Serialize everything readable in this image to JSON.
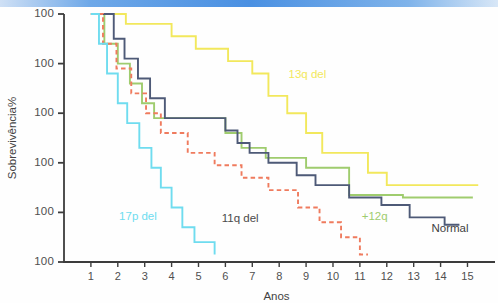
{
  "chart_data": {
    "type": "line",
    "subtype": "kaplan-meier-step",
    "title": "",
    "xlabel": "Anos",
    "ylabel": "Sobrevivência%",
    "xlim": [
      0,
      15.8
    ],
    "ylim": [
      0,
      100
    ],
    "grid": false,
    "legend_position": "inline-annotations",
    "xticks": [
      1,
      2,
      3,
      4,
      5,
      6,
      7,
      8,
      9,
      10,
      11,
      12,
      13,
      14,
      15
    ],
    "xtick_labels": [
      "1",
      "2",
      "3",
      "4",
      "5",
      "6",
      "7",
      "8",
      "9",
      "10",
      "11",
      "12",
      "13",
      "14",
      "15"
    ],
    "ytick_labels": [
      "100",
      "100",
      "100",
      "100",
      "100",
      "100"
    ],
    "ytick_values": [
      100,
      80,
      60,
      40,
      20,
      0
    ],
    "ytick_note": "All six y-axis tick labels are rendered as '100' in the source scan",
    "series": [
      {
        "name": "13q del",
        "color": "#f2e85c",
        "dashed": false,
        "label_x": 9.05,
        "label_y": 74,
        "points": [
          [
            1,
            100
          ],
          [
            2.3,
            100
          ],
          [
            2.3,
            96
          ],
          [
            4.0,
            96
          ],
          [
            4.0,
            91
          ],
          [
            4.9,
            91
          ],
          [
            4.9,
            86
          ],
          [
            6.1,
            86
          ],
          [
            6.1,
            81
          ],
          [
            7.0,
            81
          ],
          [
            7.0,
            76
          ],
          [
            7.6,
            76
          ],
          [
            7.6,
            67
          ],
          [
            8.3,
            67
          ],
          [
            8.3,
            60
          ],
          [
            9.0,
            60
          ],
          [
            9.0,
            52
          ],
          [
            9.6,
            52
          ],
          [
            9.6,
            44
          ],
          [
            11.3,
            44
          ],
          [
            11.3,
            36
          ],
          [
            12.0,
            36
          ],
          [
            12.0,
            31
          ],
          [
            15.4,
            31
          ]
        ]
      },
      {
        "name": "+12q",
        "color": "#9fcc6e",
        "dashed": false,
        "label_x": 11.55,
        "label_y": 17,
        "points": [
          [
            1,
            100
          ],
          [
            1.5,
            100
          ],
          [
            1.5,
            88
          ],
          [
            2.0,
            88
          ],
          [
            2.0,
            80
          ],
          [
            2.45,
            80
          ],
          [
            2.45,
            72
          ],
          [
            2.9,
            72
          ],
          [
            2.9,
            64
          ],
          [
            3.35,
            64
          ],
          [
            3.35,
            58
          ],
          [
            6.0,
            58
          ],
          [
            6.0,
            52
          ],
          [
            6.6,
            52
          ],
          [
            6.6,
            46
          ],
          [
            7.5,
            46
          ],
          [
            7.5,
            42
          ],
          [
            9.0,
            42
          ],
          [
            9.0,
            38
          ],
          [
            10.6,
            38
          ],
          [
            10.6,
            27
          ],
          [
            12.6,
            27
          ],
          [
            12.6,
            26
          ],
          [
            15.2,
            26
          ]
        ]
      },
      {
        "name": "Normal",
        "color": "#4e5a77",
        "dashed": false,
        "label_x": 14.35,
        "label_y": 12,
        "points": [
          [
            1,
            100
          ],
          [
            1.85,
            100
          ],
          [
            1.85,
            90
          ],
          [
            2.25,
            90
          ],
          [
            2.25,
            82
          ],
          [
            2.75,
            82
          ],
          [
            2.75,
            74
          ],
          [
            3.2,
            74
          ],
          [
            3.2,
            66
          ],
          [
            3.75,
            66
          ],
          [
            3.75,
            58
          ],
          [
            6.0,
            58
          ],
          [
            6.0,
            53
          ],
          [
            6.45,
            53
          ],
          [
            6.45,
            48
          ],
          [
            6.9,
            48
          ],
          [
            6.9,
            44
          ],
          [
            7.6,
            44
          ],
          [
            7.6,
            40
          ],
          [
            8.65,
            40
          ],
          [
            8.65,
            35
          ],
          [
            9.35,
            35
          ],
          [
            9.35,
            31
          ],
          [
            10.6,
            31
          ],
          [
            10.6,
            26
          ],
          [
            11.8,
            26
          ],
          [
            11.8,
            23
          ],
          [
            12.85,
            23
          ],
          [
            12.85,
            18
          ],
          [
            14.15,
            18
          ],
          [
            14.15,
            15
          ],
          [
            14.7,
            15
          ]
        ]
      },
      {
        "name": "11q del",
        "color": "#ef7b5e",
        "dashed": true,
        "label_x": 6.55,
        "label_y": 16,
        "points": [
          [
            1,
            100
          ],
          [
            1.45,
            100
          ],
          [
            1.45,
            88
          ],
          [
            1.95,
            88
          ],
          [
            1.95,
            78
          ],
          [
            2.5,
            78
          ],
          [
            2.5,
            68
          ],
          [
            3.05,
            68
          ],
          [
            3.05,
            60
          ],
          [
            3.6,
            60
          ],
          [
            3.6,
            52
          ],
          [
            4.6,
            52
          ],
          [
            4.6,
            44
          ],
          [
            5.6,
            44
          ],
          [
            5.6,
            39
          ],
          [
            6.6,
            39
          ],
          [
            6.6,
            34
          ],
          [
            7.6,
            34
          ],
          [
            7.6,
            29
          ],
          [
            8.7,
            29
          ],
          [
            8.7,
            22
          ],
          [
            9.5,
            22
          ],
          [
            9.5,
            16
          ],
          [
            10.3,
            16
          ],
          [
            10.3,
            10
          ],
          [
            11.0,
            10
          ],
          [
            11.0,
            3
          ],
          [
            11.3,
            3
          ]
        ]
      },
      {
        "name": "17p del",
        "color": "#6fdcef",
        "dashed": false,
        "label_x": 2.75,
        "label_y": 17,
        "points": [
          [
            1,
            100
          ],
          [
            1.3,
            100
          ],
          [
            1.3,
            88
          ],
          [
            1.6,
            88
          ],
          [
            1.6,
            76
          ],
          [
            2.0,
            76
          ],
          [
            2.0,
            64
          ],
          [
            2.35,
            64
          ],
          [
            2.35,
            56
          ],
          [
            2.8,
            56
          ],
          [
            2.8,
            46
          ],
          [
            3.25,
            46
          ],
          [
            3.25,
            38
          ],
          [
            3.6,
            38
          ],
          [
            3.6,
            30
          ],
          [
            4.0,
            30
          ],
          [
            4.0,
            22
          ],
          [
            4.4,
            22
          ],
          [
            4.4,
            14
          ],
          [
            4.85,
            14
          ],
          [
            4.85,
            8
          ],
          [
            5.6,
            8
          ],
          [
            5.6,
            3
          ]
        ]
      }
    ]
  }
}
